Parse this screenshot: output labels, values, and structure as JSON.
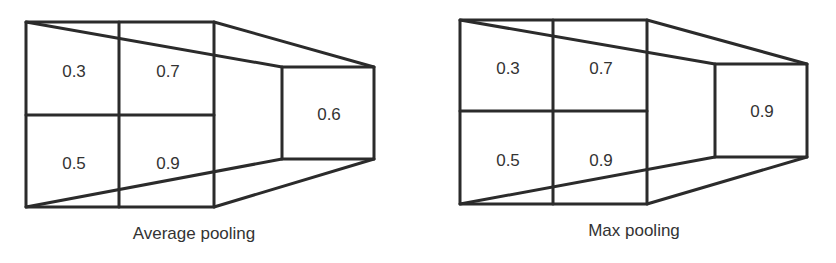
{
  "diagrams": [
    {
      "caption": "Average pooling",
      "input_grid": [
        [
          "0.3",
          "0.7"
        ],
        [
          "0.5",
          "0.9"
        ]
      ],
      "output_value": "0.6"
    },
    {
      "caption": "Max pooling",
      "input_grid": [
        [
          "0.3",
          "0.7"
        ],
        [
          "0.5",
          "0.9"
        ]
      ],
      "output_value": "0.9"
    }
  ],
  "colors": {
    "line": "#2b2b2b",
    "text": "#333333",
    "background": "#ffffff"
  }
}
